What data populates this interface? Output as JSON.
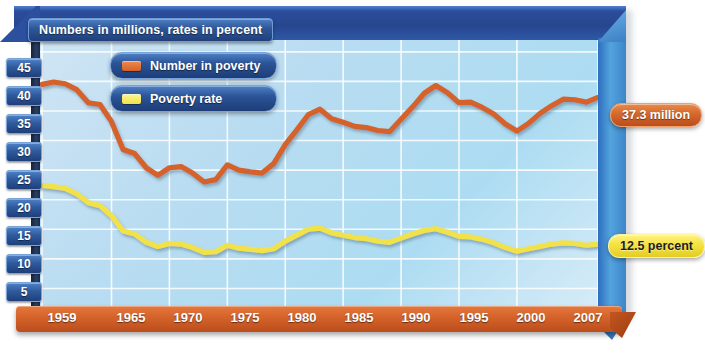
{
  "chart": {
    "title": "Numbers in millions, rates in percent",
    "legend": [
      {
        "label": "Number in poverty",
        "color": "#d4622a",
        "icon": "orange-swatch"
      },
      {
        "label": "Poverty rate",
        "color": "#f2e24a",
        "icon": "yellow-swatch"
      }
    ],
    "callouts": [
      {
        "name": "number-in-poverty-value",
        "text": "37.3 million"
      },
      {
        "name": "poverty-rate-value",
        "text": "12.5 percent"
      }
    ]
  },
  "chart_data": {
    "type": "line",
    "title": "Numbers in millions, rates in percent",
    "xlabel": "",
    "ylabel": "",
    "xlim": [
      1959,
      2007
    ],
    "ylim": [
      0,
      47
    ],
    "grid": true,
    "legend_position": "upper-center",
    "ytick_labels": [
      "45",
      "40",
      "35",
      "30",
      "25",
      "20",
      "15",
      "10",
      "5"
    ],
    "yticks": [
      45,
      40,
      35,
      30,
      25,
      20,
      15,
      10,
      5
    ],
    "xtick_labels": [
      "1959",
      "1965",
      "1970",
      "1975",
      "1980",
      "1985",
      "1990",
      "1995",
      "2000",
      "2007"
    ],
    "xticks": [
      1959,
      1965,
      1970,
      1975,
      1980,
      1985,
      1990,
      1995,
      2000,
      2007
    ],
    "x": [
      1959,
      1960,
      1961,
      1962,
      1963,
      1964,
      1965,
      1966,
      1967,
      1968,
      1969,
      1970,
      1971,
      1972,
      1973,
      1974,
      1975,
      1976,
      1977,
      1978,
      1979,
      1980,
      1981,
      1982,
      1983,
      1984,
      1985,
      1986,
      1987,
      1988,
      1989,
      1990,
      1991,
      1992,
      1993,
      1994,
      1995,
      1996,
      1997,
      1998,
      1999,
      2000,
      2001,
      2002,
      2003,
      2004,
      2005,
      2006,
      2007
    ],
    "series": [
      {
        "name": "Number in poverty",
        "color": "#d4622a",
        "unit": "millions",
        "end_label": "37.3 million",
        "values": [
          39.5,
          39.9,
          39.6,
          38.6,
          36.4,
          36.1,
          33.2,
          28.5,
          27.8,
          25.4,
          24.1,
          25.4,
          25.6,
          24.5,
          23.0,
          23.4,
          25.9,
          25.0,
          24.7,
          24.5,
          26.1,
          29.3,
          31.8,
          34.4,
          35.3,
          33.7,
          33.1,
          32.4,
          32.2,
          31.7,
          31.5,
          33.6,
          35.7,
          38.0,
          39.3,
          38.1,
          36.4,
          36.5,
          35.6,
          34.5,
          32.8,
          31.6,
          32.9,
          34.6,
          35.9,
          37.0,
          36.9,
          36.5,
          37.3
        ]
      },
      {
        "name": "Poverty rate",
        "color": "#f2e24a",
        "unit": "percent",
        "end_label": "12.5 percent",
        "values": [
          22.4,
          22.2,
          21.9,
          21.0,
          19.5,
          19.0,
          17.3,
          14.7,
          14.2,
          12.8,
          12.1,
          12.6,
          12.5,
          11.9,
          11.1,
          11.2,
          12.3,
          11.8,
          11.6,
          11.4,
          11.7,
          13.0,
          14.0,
          15.0,
          15.2,
          14.4,
          14.0,
          13.6,
          13.4,
          13.0,
          12.8,
          13.5,
          14.2,
          14.8,
          15.1,
          14.5,
          13.8,
          13.7,
          13.3,
          12.7,
          11.9,
          11.3,
          11.7,
          12.1,
          12.5,
          12.7,
          12.6,
          12.3,
          12.5
        ]
      }
    ]
  },
  "axis": {
    "yticks": [
      {
        "label": "45",
        "top": 58
      },
      {
        "label": "40",
        "top": 86
      },
      {
        "label": "35",
        "top": 114
      },
      {
        "label": "30",
        "top": 142
      },
      {
        "label": "25",
        "top": 170
      },
      {
        "label": "20",
        "top": 198
      },
      {
        "label": "15",
        "top": 226
      },
      {
        "label": "10",
        "top": 254
      },
      {
        "label": "5",
        "top": 282
      }
    ],
    "xticks": [
      {
        "label": "1959",
        "left": 62
      },
      {
        "label": "1965",
        "left": 131
      },
      {
        "label": "1970",
        "left": 188
      },
      {
        "label": "1975",
        "left": 245
      },
      {
        "label": "1980",
        "left": 302
      },
      {
        "label": "1985",
        "left": 359
      },
      {
        "label": "1990",
        "left": 416
      },
      {
        "label": "1995",
        "left": 474
      },
      {
        "label": "2000",
        "left": 531
      },
      {
        "label": "2007",
        "left": 588
      }
    ]
  }
}
